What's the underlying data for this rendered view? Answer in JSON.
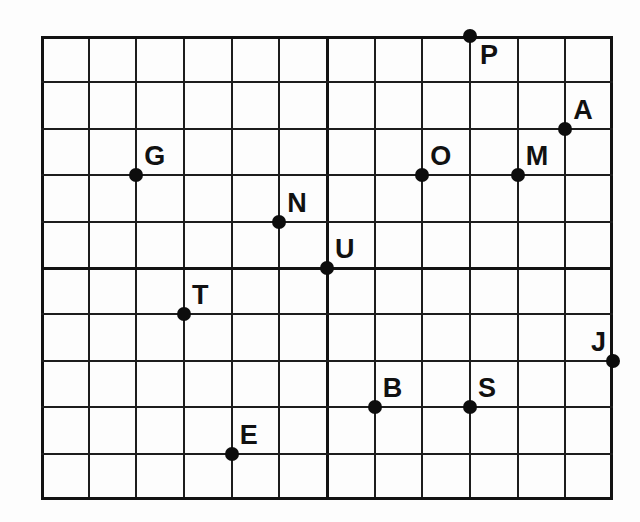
{
  "figure": {
    "description_colors": {
      "background": "#fdfdfd",
      "grid_line": "#1d1d1d",
      "axis_line": "#121212",
      "point": "#0d0d0d",
      "label": "#111111"
    }
  },
  "chart_data": {
    "type": "scatter",
    "title": "",
    "xlabel": "",
    "ylabel": "",
    "grid": true,
    "grid_cols": 12,
    "grid_rows": 10,
    "origin_col": 6,
    "origin_row": 5,
    "x_range": [
      -6,
      6
    ],
    "y_range": [
      -5,
      5
    ],
    "axes_cross_at_origin": true,
    "points": [
      {
        "label": "P",
        "x": 3,
        "y": 5,
        "label_position": "below-right"
      },
      {
        "label": "A",
        "x": 5,
        "y": 3,
        "label_position": "above-right"
      },
      {
        "label": "G",
        "x": -4,
        "y": 2,
        "label_position": "above-right"
      },
      {
        "label": "O",
        "x": 2,
        "y": 2,
        "label_position": "above-right"
      },
      {
        "label": "M",
        "x": 4,
        "y": 2,
        "label_position": "above-right"
      },
      {
        "label": "N",
        "x": -1,
        "y": 1,
        "label_position": "above-right"
      },
      {
        "label": "U",
        "x": 0,
        "y": 0,
        "label_position": "above-right"
      },
      {
        "label": "T",
        "x": -3,
        "y": -1,
        "label_position": "above-right"
      },
      {
        "label": "J",
        "x": 6,
        "y": -2,
        "label_position": "above-left"
      },
      {
        "label": "B",
        "x": 1,
        "y": -3,
        "label_position": "above-right"
      },
      {
        "label": "S",
        "x": 3,
        "y": -3,
        "label_position": "above-right"
      },
      {
        "label": "E",
        "x": -2,
        "y": -4,
        "label_position": "above-right"
      }
    ]
  }
}
